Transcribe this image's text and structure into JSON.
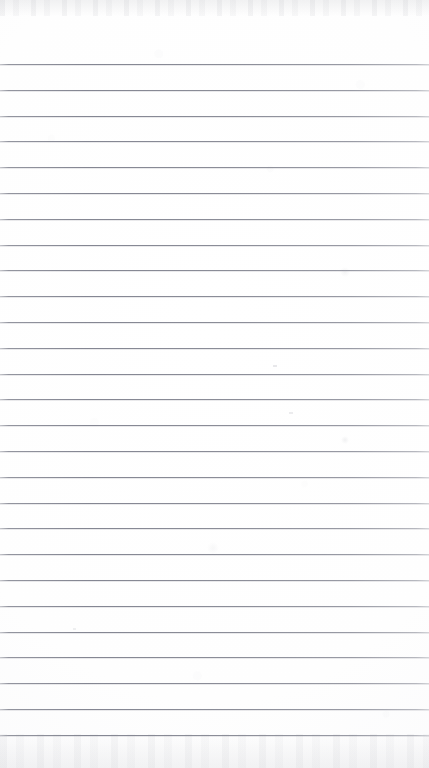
{
  "document": {
    "kind": "scanned-lined-paper",
    "title": "Blank Ruled Notepad Page",
    "content_text": "",
    "page_width_px": 429,
    "page_height_px": 768,
    "orientation": "portrait"
  },
  "colors": {
    "paper": "#fdfdfd",
    "paper_edge": "#f7f7f9",
    "rule_line": "#86889a",
    "rule_line_soft": "#9a9ca6",
    "scan_shadow": "#969aa0"
  },
  "ruling": {
    "style": "wide-ruled horizontal lines",
    "first_line_y": 64,
    "last_line_y": 734,
    "line_spacing_px": 25.8,
    "line_count": 27,
    "line_thickness_px": 1,
    "left_margin_rule": false,
    "header_space_px": 64,
    "footer_space_px": 34,
    "line_positions": [
      64,
      89.8,
      115.6,
      141.4,
      167.2,
      193,
      218.8,
      244.6,
      270.4,
      296.2,
      322,
      347.8,
      373.6,
      399.4,
      425.2,
      451,
      476.8,
      502.6,
      528.4,
      554.2,
      580,
      605.8,
      631.6,
      657.4,
      683.2,
      709,
      734.8
    ]
  },
  "artifacts": {
    "description": "faint scanner smudges and specks on the blank page",
    "marks": [
      {
        "name": "smudge-upper-right",
        "x": 345,
        "y": 272,
        "size": 10,
        "opacity": 0.1
      },
      {
        "name": "speck-mid-left",
        "x": 275,
        "y": 367,
        "size": 4,
        "opacity": 0.22
      },
      {
        "name": "speck-mid-center",
        "x": 291,
        "y": 414,
        "size": 4,
        "opacity": 0.18
      },
      {
        "name": "smudge-mid-right",
        "x": 345,
        "y": 440,
        "size": 8,
        "opacity": 0.13
      },
      {
        "name": "smudge-lower-center",
        "x": 213,
        "y": 548,
        "size": 12,
        "opacity": 0.07
      },
      {
        "name": "speck-lower-left",
        "x": 74,
        "y": 629,
        "size": 3,
        "opacity": 0.15
      }
    ]
  }
}
